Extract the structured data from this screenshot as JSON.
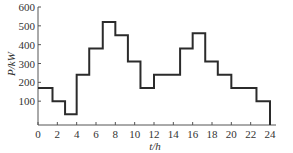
{
  "chart_data": {
    "type": "line",
    "subtype": "step",
    "title": "",
    "xlabel": "t/h",
    "ylabel": "P/kW",
    "xlim": [
      0,
      24
    ],
    "ylim": [
      0,
      600
    ],
    "xticks": [
      0,
      2,
      4,
      6,
      8,
      10,
      12,
      14,
      16,
      18,
      20,
      22,
      24
    ],
    "yticks": [
      100,
      200,
      300,
      400,
      500,
      600
    ],
    "grid": false,
    "legend": null,
    "segments": [
      {
        "start": 0,
        "end": 1.5,
        "value": 170
      },
      {
        "start": 1.5,
        "end": 2.8,
        "value": 100
      },
      {
        "start": 2.8,
        "end": 4,
        "value": 30
      },
      {
        "start": 4,
        "end": 5.3,
        "value": 240
      },
      {
        "start": 5.3,
        "end": 6.7,
        "value": 380
      },
      {
        "start": 6.7,
        "end": 8,
        "value": 520
      },
      {
        "start": 8,
        "end": 9.3,
        "value": 450
      },
      {
        "start": 9.3,
        "end": 10.6,
        "value": 310
      },
      {
        "start": 10.6,
        "end": 12,
        "value": 170
      },
      {
        "start": 12,
        "end": 14.7,
        "value": 240
      },
      {
        "start": 14.7,
        "end": 16,
        "value": 380
      },
      {
        "start": 16,
        "end": 17.3,
        "value": 460
      },
      {
        "start": 17.3,
        "end": 18.6,
        "value": 310
      },
      {
        "start": 18.6,
        "end": 20,
        "value": 240
      },
      {
        "start": 20,
        "end": 22.6,
        "value": 170
      },
      {
        "start": 22.6,
        "end": 24,
        "value": 100
      }
    ]
  },
  "colors": {
    "line": "#2b2b2b",
    "axis": "#555555"
  }
}
